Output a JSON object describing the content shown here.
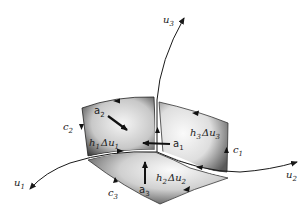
{
  "diagram": {
    "axes": [
      {
        "id": "u1",
        "base": "u",
        "sub": "1"
      },
      {
        "id": "u2",
        "base": "u",
        "sub": "2"
      },
      {
        "id": "u3",
        "base": "u",
        "sub": "3"
      }
    ],
    "curves": [
      {
        "id": "c1",
        "base": "c",
        "sub": "1"
      },
      {
        "id": "c2",
        "base": "c",
        "sub": "2"
      },
      {
        "id": "c3",
        "base": "c",
        "sub": "3"
      }
    ],
    "unit_vectors": [
      {
        "id": "a1",
        "base": "a",
        "sub": "1"
      },
      {
        "id": "a2",
        "base": "a",
        "sub": "2"
      },
      {
        "id": "a3",
        "base": "a",
        "sub": "3"
      }
    ],
    "faces": [
      {
        "id": "face-1",
        "h": "h",
        "h_sub": "1",
        "delta": "Δ",
        "u": "u",
        "u_sub": "1"
      },
      {
        "id": "face-2",
        "h": "h",
        "h_sub": "2",
        "delta": "Δ",
        "u": "u",
        "u_sub": "2"
      },
      {
        "id": "face-3",
        "h": "h",
        "h_sub": "3",
        "delta": "Δ",
        "u": "u",
        "u_sub": "3"
      }
    ],
    "colors": {
      "stroke": "#1a1a1a",
      "face_dark": "#3a3a3a",
      "face_light": "#f2f2f2",
      "background": "#ffffff"
    }
  }
}
